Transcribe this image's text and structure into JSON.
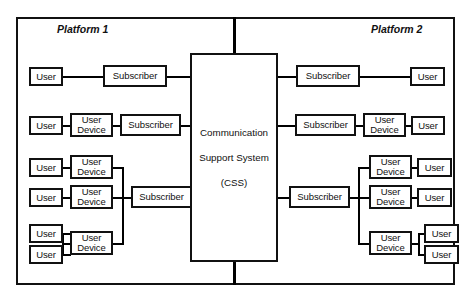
{
  "diagram": {
    "platforms": [
      {
        "label": "Platform 1"
      },
      {
        "label": "Platform 2"
      }
    ],
    "hub": {
      "lines": [
        "Communication",
        "Support System",
        "(CSS)"
      ]
    },
    "labels": {
      "user": "User",
      "user_device": "User\nDevice",
      "user_device_l1": "User",
      "user_device_l2": "Device",
      "subscriber": "Subscriber"
    },
    "left_platform": {
      "groups": [
        {
          "subscriber": "Subscriber",
          "branches": [
            {
              "device": null,
              "users": [
                "User"
              ]
            }
          ]
        },
        {
          "subscriber": "Subscriber",
          "branches": [
            {
              "device": "User Device",
              "users": [
                "User"
              ]
            }
          ]
        },
        {
          "subscriber": "Subscriber",
          "branches": [
            {
              "device": "User Device",
              "users": [
                "User"
              ]
            },
            {
              "device": "User Device",
              "users": [
                "User"
              ]
            },
            {
              "device": "User Device",
              "users": [
                "User",
                "User"
              ]
            }
          ]
        }
      ]
    },
    "right_platform": {
      "groups": [
        {
          "subscriber": "Subscriber",
          "branches": [
            {
              "device": null,
              "users": [
                "User"
              ]
            }
          ]
        },
        {
          "subscriber": "Subscriber",
          "branches": [
            {
              "device": "User Device",
              "users": [
                "User"
              ]
            }
          ]
        },
        {
          "subscriber": "Subscriber",
          "branches": [
            {
              "device": "User Device",
              "users": [
                "User"
              ]
            },
            {
              "device": "User Device",
              "users": [
                "User"
              ]
            },
            {
              "device": "User Device",
              "users": [
                "User",
                "User"
              ]
            }
          ]
        }
      ]
    },
    "colors": {
      "stroke": "#111111",
      "background": "#ffffff"
    }
  }
}
